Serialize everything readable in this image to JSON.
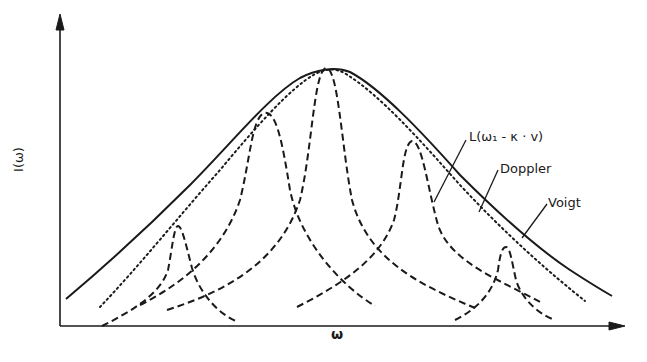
{
  "figure": {
    "y_axis_label": "I(ω)",
    "x_axis_label": "ω",
    "annotations": {
      "lorentzian": "L(ω₁ - κ · v)",
      "doppler": "Doppler",
      "voigt": "Voigt"
    }
  },
  "curves": {
    "voigt": {
      "style": "solid",
      "description": "Voigt profile envelope"
    },
    "doppler": {
      "style": "dotted",
      "description": "Gaussian Doppler profile"
    },
    "lorentzians": {
      "style": "dashed",
      "peaks": [
        {
          "center_x": 178,
          "peak_y": 226
        },
        {
          "center_x": 266,
          "peak_y": 113
        },
        {
          "center_x": 326,
          "peak_y": 68
        },
        {
          "center_x": 414,
          "peak_y": 141
        },
        {
          "center_x": 505,
          "peak_y": 247
        }
      ]
    }
  },
  "colors": {
    "ink": "#1a1a1a",
    "background": "#ffffff"
  }
}
